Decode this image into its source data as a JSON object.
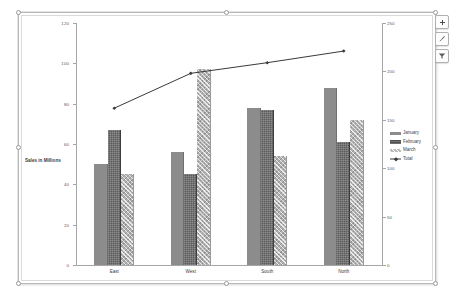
{
  "chart_object": {
    "selected": true,
    "buttons": [
      {
        "name": "chart-elements-button",
        "icon": "plus-icon",
        "label": "+"
      },
      {
        "name": "chart-styles-button",
        "icon": "paintbrush-icon",
        "label": ""
      },
      {
        "name": "chart-filters-button",
        "icon": "filter-icon",
        "label": ""
      }
    ]
  },
  "chart_data": {
    "type": "bar",
    "title": "",
    "subtitle": "",
    "xlabel": "",
    "ylabel": "Sales in Millions",
    "categories": [
      "East",
      "West",
      "South",
      "North"
    ],
    "series": [
      {
        "name": "January",
        "type": "bar",
        "axis": "left",
        "values": [
          50,
          56,
          78,
          88
        ],
        "color": "#8c8c8c"
      },
      {
        "name": "February",
        "type": "bar",
        "axis": "left",
        "values": [
          67,
          45,
          77,
          61
        ],
        "color": "#5a5a5a"
      },
      {
        "name": "March",
        "type": "bar",
        "axis": "left",
        "values": [
          45,
          97,
          54,
          72
        ],
        "color": "#b2b2b2"
      },
      {
        "name": "Total",
        "type": "line",
        "axis": "right",
        "values": [
          162,
          198,
          209,
          221
        ],
        "color": "#3a3a3a"
      }
    ],
    "ylim": [
      0,
      120
    ],
    "y2lim": [
      0,
      250
    ],
    "yticks": [
      0,
      20,
      40,
      60,
      80,
      100,
      120
    ],
    "y2ticks": [
      0,
      50,
      100,
      150,
      200,
      250
    ],
    "ytick_labels": [
      "0",
      "20",
      "40",
      "60",
      "80",
      "100",
      "120"
    ],
    "y2tick_labels": [
      "0",
      "50",
      "100",
      "150",
      "200",
      "250"
    ],
    "grid": true,
    "grid_minor": true,
    "legend_position": "right",
    "legend": [
      "January",
      "February",
      "March",
      "Total"
    ]
  }
}
